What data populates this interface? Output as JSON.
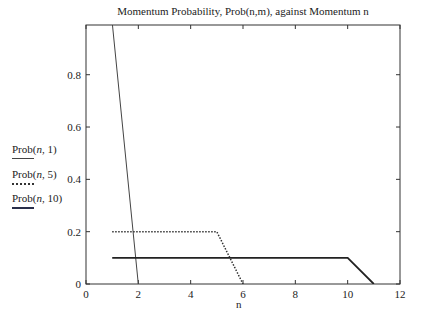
{
  "chart_data": {
    "type": "line",
    "title": "Momentum Probability, Prob(n,m), against Momentum n",
    "xlabel": "n",
    "ylabel": "",
    "xlim": [
      0,
      12
    ],
    "ylim": [
      0,
      0.99
    ],
    "xticks": [
      0,
      2,
      4,
      6,
      8,
      10,
      12
    ],
    "yticks": [
      0,
      0.2,
      0.4,
      0.6,
      0.8
    ],
    "grid": false,
    "legend_position": "left-outside",
    "series": [
      {
        "name": "Prob(n, 1)",
        "style": "solid-thin",
        "x": [
          1,
          2
        ],
        "y": [
          1.0,
          0
        ]
      },
      {
        "name": "Prob(n, 5)",
        "style": "dotted",
        "x": [
          1,
          5,
          6
        ],
        "y": [
          0.2,
          0.2,
          0
        ]
      },
      {
        "name": "Prob(n, 10)",
        "style": "solid-thick",
        "x": [
          1,
          10,
          11
        ],
        "y": [
          0.1,
          0.1,
          0
        ]
      }
    ]
  },
  "legend": [
    {
      "label_prefix": "Prob(",
      "label_var": "n",
      "label_suffix": ", 1)"
    },
    {
      "label_prefix": "Prob(",
      "label_var": "n",
      "label_suffix": ", 5)"
    },
    {
      "label_prefix": "Prob(",
      "label_var": "n",
      "label_suffix": ", 10)"
    }
  ]
}
